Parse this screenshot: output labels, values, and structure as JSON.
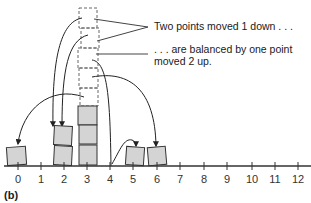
{
  "figure": {
    "panel_label": "(b)",
    "annotations": {
      "top": "Two points moved 1 down . . .",
      "bottom_line1": ". . . are balanced by one point",
      "bottom_line2": "moved 2 up."
    },
    "axis": {
      "ticks": [
        "0",
        "1",
        "2",
        "3",
        "4",
        "5",
        "6",
        "7",
        "8",
        "9",
        "10",
        "11",
        "12"
      ],
      "balance_point": 4
    },
    "final_stacks": [
      {
        "position": 0,
        "count": 1
      },
      {
        "position": 2,
        "count": 2
      },
      {
        "position": 3,
        "count": 3
      },
      {
        "position": 5,
        "count": 1
      },
      {
        "position": 6,
        "count": 1
      }
    ],
    "original_stack_dashed": {
      "position": 3,
      "count": 4,
      "note": "dashed boxes above column 3 showing original positions"
    },
    "moves": [
      {
        "from": "dashed box 1 (top)",
        "to": 2,
        "label": "moved down"
      },
      {
        "from": "dashed box 2",
        "to": 2,
        "label": "moved down"
      },
      {
        "from": "dashed box 3",
        "to": 4,
        "label": "balance line"
      },
      {
        "from": "dashed box 4",
        "to": 6
      },
      {
        "from": 4,
        "to": 5,
        "label": "moved 2 up"
      },
      {
        "from": "dashed box (lower)",
        "to": 0
      }
    ],
    "colors": {
      "box_fill": "#d4d4d4",
      "box_stroke": "#333333",
      "dashed_stroke": "#666666",
      "axis": "#333333"
    }
  }
}
